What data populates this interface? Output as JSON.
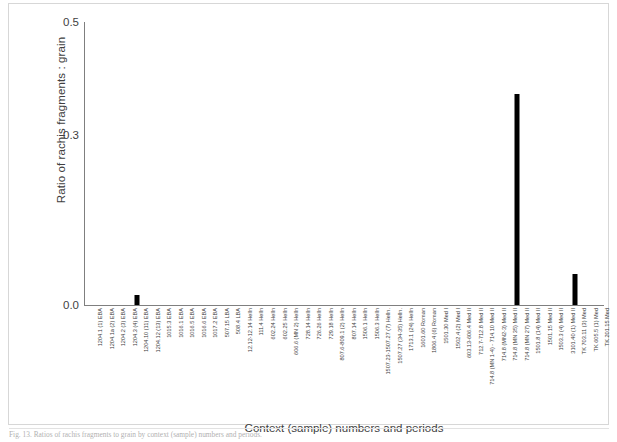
{
  "figure": {
    "frame_border_color": "#d7d7d7",
    "caption": "Fig. 13. Ratios of rachis fragments to grain by context (sample) numbers and periods."
  },
  "chart_data": {
    "type": "bar",
    "title": "",
    "xlabel": "Context (sample) numbers and periods",
    "ylabel": "Ratio of rachis fragments : grain",
    "ylim": [
      0.0,
      0.5
    ],
    "yticks": [
      "0.0",
      "0.3",
      "0.5"
    ],
    "ytick_values": [
      0.0,
      0.3,
      0.5
    ],
    "grid": false,
    "legend": false,
    "bar_color": "#000000",
    "categories": [
      "1204.1 (1) EBA",
      "1204.1a (2) EBA",
      "1204.2 (3) EBA",
      "1204.3 (4) EBA",
      "1204.10 (11) EBA",
      "1204.12 (13) EBA",
      "1015.3  EBA",
      "1016.1 EBA",
      "1016.5 EBA",
      "1016.6 EBA",
      "1017.2 EBA",
      "507.15 LBA",
      "508.4 LBA",
      "12.12-12.14 Helln",
      "111.4 Helln",
      "602.24 Helln",
      "602.25 Helln",
      "606.6 (MN 2) Helln",
      "728.14 Helln",
      "726.26 Helln",
      "729.18 Helln",
      "807.6-809.1 (2) Helln",
      "807.14 Helln",
      "1506.1 Helln",
      "1506.3 Helln",
      "1507.23-1507.27 (7) Helln.",
      "1507.27 (34-35) Helln.",
      "1713.1 (24) Helln",
      "1601.60 Roman",
      "1806.4 (6) Roman",
      "1501.30 Med I",
      "1502.4 (2) Med I",
      "603.13-606.4 Med II",
      "712.7-712.8 Med II",
      "714.8 (MN 1-4) - 714.10 Med II",
      "714.8 (MN2-3) Med II",
      "714.8 (MN 35) Med II",
      "714.8 (MN 27) Med II",
      "1501.8 (14) Med II",
      "1501.15 Med II",
      "1503.3 (4) Med II",
      "3101.40 (1) Med II",
      "TK 703.11 (3) Med",
      "TK 605.5 (1) Med",
      "TK 201.15 Med"
    ],
    "values": [
      0,
      0,
      0,
      0,
      0.018,
      0,
      0,
      0,
      0,
      0,
      0,
      0,
      0,
      0,
      0,
      0,
      0,
      0,
      0,
      0,
      0,
      0,
      0,
      0,
      0,
      0,
      0,
      0,
      0,
      0,
      0,
      0,
      0,
      0,
      0,
      0,
      0,
      0.372,
      0,
      0,
      0,
      0,
      0.055,
      0,
      0
    ]
  }
}
